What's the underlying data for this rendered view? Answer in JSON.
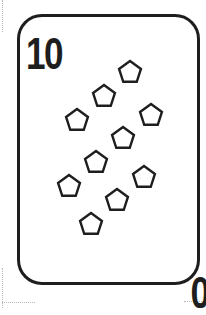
{
  "card": {
    "rank_top": "10",
    "rank_bottom": "10",
    "suit_icon": "pentagon-icon",
    "pip_count": 10,
    "colors": {
      "border": "#1e1e1e",
      "ink": "#1e1e1e",
      "background": "#ffffff"
    }
  },
  "pips": [
    {
      "cx": 130,
      "cy": 72
    },
    {
      "cx": 104,
      "cy": 96
    },
    {
      "cx": 77,
      "cy": 120
    },
    {
      "cx": 151,
      "cy": 115
    },
    {
      "cx": 123,
      "cy": 138
    },
    {
      "cx": 96,
      "cy": 162
    },
    {
      "cx": 144,
      "cy": 177
    },
    {
      "cx": 69,
      "cy": 186
    },
    {
      "cx": 117,
      "cy": 200
    },
    {
      "cx": 91,
      "cy": 224
    }
  ]
}
